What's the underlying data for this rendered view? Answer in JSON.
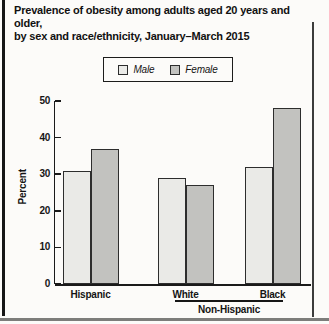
{
  "title_line1": "Prevalence of obesity among adults aged 20 years and older,",
  "title_line2": "by sex and race/ethnicity, January–March 2015",
  "legend": {
    "items": [
      {
        "label": "Male",
        "color": "#eaeae7"
      },
      {
        "label": "Female",
        "color": "#c2c2bf"
      }
    ]
  },
  "chart_data": {
    "type": "bar",
    "title": "Prevalence of obesity among adults aged 20 years and older, by sex and race/ethnicity, January–March 2015",
    "categories": [
      "Hispanic",
      "White",
      "Black"
    ],
    "series": [
      {
        "name": "Male",
        "values": [
          31,
          29,
          32
        ],
        "color": "#eaeae7"
      },
      {
        "name": "Female",
        "values": [
          37,
          27,
          48
        ],
        "color": "#c2c2bf"
      }
    ],
    "group_annotation": {
      "label": "Non-Hispanic",
      "covers": [
        "White",
        "Black"
      ]
    },
    "xlabel": "",
    "ylabel": "Percent",
    "ylim": [
      0,
      50
    ],
    "yticks": [
      0,
      10,
      20,
      30,
      40,
      50
    ],
    "grid": false,
    "legend_position": "top"
  }
}
